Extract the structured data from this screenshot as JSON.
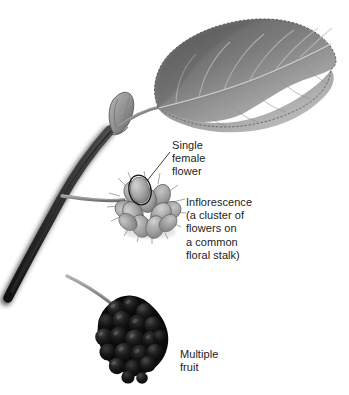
{
  "figure": {
    "background_color": "#ffffff",
    "width": 349,
    "height": 395
  },
  "labels": {
    "single_female_flower": "Single\nfemale\nflower",
    "inflorescence": "Inflorescence\n(a cluster of\nflowers on\na common\nfloral stalk)",
    "multiple_fruit": "Multiple\nfruit"
  },
  "parts": {
    "leaf": "leaf",
    "bud": "terminal-bud",
    "stem": "woody-stem",
    "petiole": "leaf-petiole",
    "peduncle": "flower-stalk",
    "inflorescence": "flower-cluster",
    "highlighted_floret": "single-female-flower-outline",
    "fruit": "multiple-fruit",
    "fruit_stalk": "fruit-stalk"
  },
  "leader_lines": {
    "single_female_flower": "from text to circled floret",
    "multiple_fruit": "none"
  },
  "colors": {
    "text": "#1c1c1c",
    "leaf_dark": "#6f6f6f",
    "leaf_light": "#b4b4b4",
    "stem_dark": "#1e1e1e",
    "stalk_gray": "#8a8a8a",
    "floret_gray": "#9a9a9a",
    "floret_light": "#c8c8c8",
    "fruit_black": "#0b0b0b",
    "fruit_highlight": "#3a3a3a",
    "outline": "#111111"
  }
}
